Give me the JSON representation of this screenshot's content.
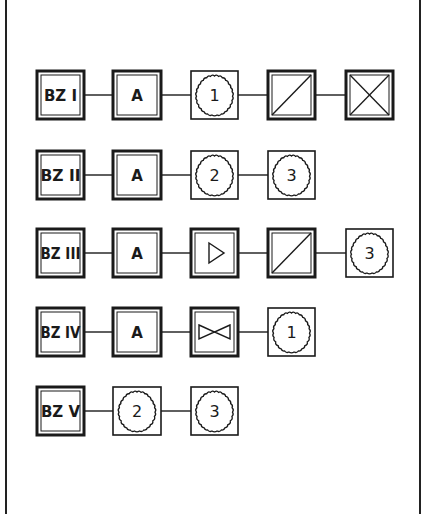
{
  "diagram": {
    "rows": [
      {
        "label": "BZ I",
        "items": [
          "A",
          "gear:1",
          "converter",
          "crossed"
        ]
      },
      {
        "label": "BZ II",
        "items": [
          "A",
          "gear:2",
          "gear:3"
        ]
      },
      {
        "label": "BZ III",
        "items": [
          "A",
          "amplifier",
          "converter",
          "gear:3"
        ]
      },
      {
        "label": "BZ IV",
        "items": [
          "A",
          "valve",
          "gear:1"
        ]
      },
      {
        "label": "BZ V",
        "items": [
          "gear:2",
          "gear:3"
        ]
      }
    ],
    "labels": {
      "r0": "BZ I",
      "r1": "BZ II",
      "r2": "BZ III",
      "r3": "BZ IV",
      "r4": "BZ V",
      "a": "A",
      "g1": "1",
      "g2": "2",
      "g3": "3"
    },
    "colors": {
      "ink": "#1a1a1a",
      "background": "#ffffff"
    }
  }
}
